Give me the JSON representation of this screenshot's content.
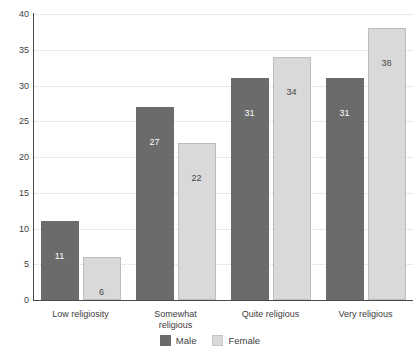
{
  "chart_data": {
    "type": "bar",
    "title": "",
    "subtitle": "",
    "xlabel": "",
    "ylabel": "",
    "ylim": [
      0,
      40
    ],
    "yticks": [
      0,
      5,
      10,
      15,
      20,
      25,
      30,
      35,
      40
    ],
    "grid": true,
    "legend_position": "bottom-center",
    "categories": [
      "Low religiosity",
      "Somewhat religious",
      "Quite religious",
      "Very religious"
    ],
    "category_lines": [
      [
        "Low religiosity"
      ],
      [
        "Somewhat",
        "religious"
      ],
      [
        "Quite religious"
      ],
      [
        "Very religious"
      ]
    ],
    "series": [
      {
        "name": "Male",
        "color": "#6b6b6b",
        "values": [
          11,
          27,
          31,
          31
        ]
      },
      {
        "name": "Female",
        "color": "#d9d9d9",
        "values": [
          6,
          22,
          34,
          38
        ]
      }
    ]
  },
  "legend": {
    "items": [
      {
        "label": "Male"
      },
      {
        "label": "Female"
      }
    ]
  },
  "colors": {
    "male": "#6b6b6b",
    "female": "#d9d9d9",
    "female_border": "#bdbdbd",
    "axis": "#4a4a4a",
    "grid": "#d6d6d6",
    "text": "#3d3d3d",
    "background": "#ffffff"
  }
}
